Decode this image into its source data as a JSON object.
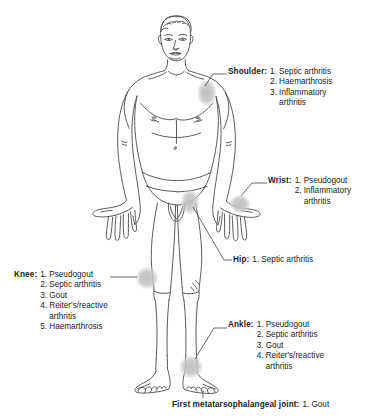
{
  "diagram": {
    "title_implicit": "Joints affected in crystal and septic arthritis",
    "figure_label": "anterior full-body male figure",
    "marker_color": "#c9c9c9",
    "outline_color": "#4a4a4a",
    "leader_color": "#555555",
    "background": "#ffffff",
    "text_color": "#1b1b1b"
  },
  "callouts": [
    {
      "id": "shoulder",
      "joint": "Shoulder:",
      "conditions": [
        {
          "num": "1.",
          "text": "Septic arthritis"
        },
        {
          "num": "2.",
          "text": "Haemarthrosis"
        },
        {
          "num": "3.",
          "text": "Inflammatory"
        },
        {
          "num": "",
          "text": "arthritis",
          "continuation": true
        }
      ]
    },
    {
      "id": "wrist",
      "joint": "Wrist:",
      "conditions": [
        {
          "num": "1.",
          "text": "Pseudogout"
        },
        {
          "num": "2.",
          "text": "Inflammatory"
        },
        {
          "num": "",
          "text": "arthritis",
          "continuation": true
        }
      ]
    },
    {
      "id": "hip",
      "joint": "Hip:",
      "conditions": [
        {
          "num": "1.",
          "text": "Septic arthritis"
        }
      ]
    },
    {
      "id": "knee",
      "joint": "Knee:",
      "conditions": [
        {
          "num": "1.",
          "text": "Pseudogout"
        },
        {
          "num": "2.",
          "text": "Septic arthritis"
        },
        {
          "num": "3.",
          "text": "Gout"
        },
        {
          "num": "4.",
          "text": "Reiter's/reactive"
        },
        {
          "num": "",
          "text": "arthritis",
          "continuation": true
        },
        {
          "num": "5.",
          "text": "Haemarthrosis"
        }
      ]
    },
    {
      "id": "ankle",
      "joint": "Ankle:",
      "conditions": [
        {
          "num": "1.",
          "text": "Pseudogout"
        },
        {
          "num": "2.",
          "text": "Septic arthritis"
        },
        {
          "num": "3.",
          "text": "Gout"
        },
        {
          "num": "4.",
          "text": "Reiter's/reactive"
        },
        {
          "num": "",
          "text": "arthritis",
          "continuation": true
        }
      ]
    },
    {
      "id": "mtp",
      "joint": "First metatarsophalangeal joint:",
      "conditions": [
        {
          "num": "1.",
          "text": "Gout"
        }
      ]
    }
  ],
  "markers": [
    {
      "id": "shoulder-marker",
      "label": "shoulder joint marker"
    },
    {
      "id": "wrist-marker",
      "label": "wrist joint marker"
    },
    {
      "id": "hip-marker",
      "label": "hip joint marker"
    },
    {
      "id": "knee-marker",
      "label": "knee joint marker"
    },
    {
      "id": "ankle-marker",
      "label": "ankle joint marker"
    },
    {
      "id": "mtp-marker",
      "label": "first metatarsophalangeal joint marker"
    }
  ]
}
